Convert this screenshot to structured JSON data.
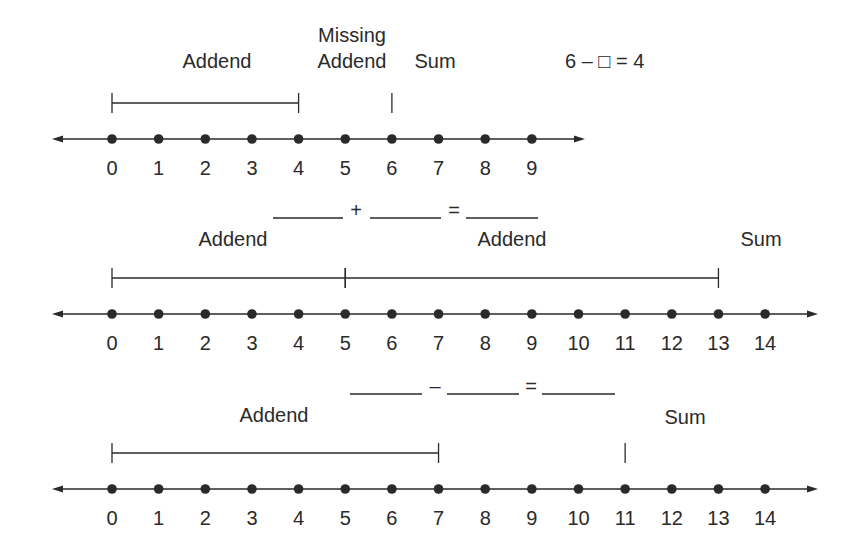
{
  "style": {
    "ink": "#2a2a2a",
    "background": "#ffffff"
  },
  "rows": [
    {
      "id": "row1",
      "axis_y": 139,
      "line_x1": 52,
      "line_x2": 585,
      "origin_x": 112,
      "spacing": 46.65,
      "ticks": [
        "0",
        "1",
        "2",
        "3",
        "4",
        "5",
        "6",
        "7",
        "8",
        "9"
      ],
      "labels": [
        {
          "text": "Addend",
          "x": 217,
          "y": 68,
          "anchor": "middle"
        },
        {
          "text": "Missing",
          "x": 352,
          "y": 42,
          "anchor": "middle"
        },
        {
          "text": "Addend",
          "x": 352,
          "y": 68,
          "anchor": "middle"
        },
        {
          "text": "Sum",
          "x": 435,
          "y": 68,
          "anchor": "middle"
        }
      ],
      "equation": {
        "text": "6 – □ = 4",
        "x": 565,
        "y": 68
      },
      "brackets": [
        {
          "from": 0,
          "to": 4
        }
      ],
      "marks": [
        6
      ],
      "bracket_y": 103
    },
    {
      "id": "row2",
      "axis_y": 314,
      "line_x1": 52,
      "line_x2": 818,
      "origin_x": 112,
      "spacing": 46.65,
      "ticks": [
        "0",
        "1",
        "2",
        "3",
        "4",
        "5",
        "6",
        "7",
        "8",
        "9",
        "10",
        "11",
        "12",
        "13",
        "14"
      ],
      "labels": [
        {
          "text": "Addend",
          "x": 233,
          "y": 246,
          "anchor": "middle"
        },
        {
          "text": "Addend",
          "x": 512,
          "y": 246,
          "anchor": "middle"
        },
        {
          "text": "Sum",
          "x": 761,
          "y": 246,
          "anchor": "middle"
        }
      ],
      "equation": {
        "blanks": [
          [
            273,
            343
          ],
          [
            370,
            441
          ],
          [
            466,
            538
          ]
        ],
        "ops": [
          {
            "t": "+",
            "x": 356
          },
          {
            "t": "=",
            "x": 454
          }
        ],
        "y": 218
      },
      "brackets": [
        {
          "from": 0,
          "to": 5
        },
        {
          "from": 5,
          "to": 13
        }
      ],
      "marks": [],
      "bracket_y": 278
    },
    {
      "id": "row3",
      "axis_y": 489,
      "line_x1": 52,
      "line_x2": 818,
      "origin_x": 112,
      "spacing": 46.65,
      "ticks": [
        "0",
        "1",
        "2",
        "3",
        "4",
        "5",
        "6",
        "7",
        "8",
        "9",
        "10",
        "11",
        "12",
        "13",
        "14"
      ],
      "labels": [
        {
          "text": "Addend",
          "x": 274,
          "y": 422,
          "anchor": "middle"
        },
        {
          "text": "Sum",
          "x": 685,
          "y": 424,
          "anchor": "middle"
        }
      ],
      "equation": {
        "blanks": [
          [
            350,
            422
          ],
          [
            447,
            519
          ],
          [
            542,
            615
          ]
        ],
        "ops": [
          {
            "t": "–",
            "x": 435
          },
          {
            "t": "=",
            "x": 531
          }
        ],
        "y": 394
      },
      "brackets": [
        {
          "from": 0,
          "to": 7
        }
      ],
      "marks": [
        11
      ],
      "bracket_y": 453
    }
  ]
}
